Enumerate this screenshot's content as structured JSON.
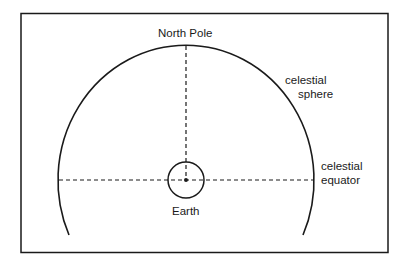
{
  "diagram": {
    "labels": {
      "north_pole": "North Pole",
      "celestial_sphere": [
        "celestial",
        "sphere"
      ],
      "celestial_equator": [
        "celestial",
        "equator"
      ],
      "earth": "Earth"
    },
    "colors": {
      "stroke": "#1a1a1a",
      "background": "#ffffff"
    }
  }
}
